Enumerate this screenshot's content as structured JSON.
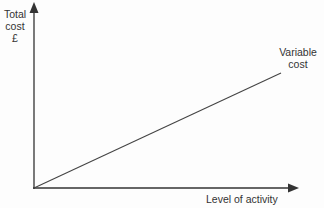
{
  "diagram": {
    "type": "cost-behaviour-graph",
    "y_axis": {
      "label_lines": [
        "Total",
        "cost",
        "£"
      ]
    },
    "x_axis": {
      "label": "Level of activity"
    },
    "lines": [
      {
        "name": "variable-cost",
        "label_lines": [
          "Variable",
          "cost"
        ],
        "from": [
          0,
          0
        ],
        "to": "increasing linearly"
      }
    ],
    "colors": {
      "axis": "#333333",
      "line": "#444444",
      "text": "#333333"
    }
  }
}
